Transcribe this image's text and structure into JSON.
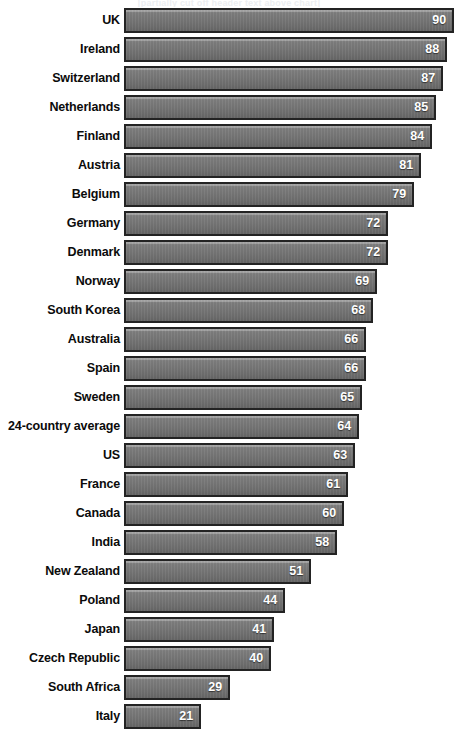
{
  "header": {
    "clipped_title": "[partially cut off header text above chart]"
  },
  "chart_data": {
    "type": "bar",
    "orientation": "horizontal",
    "title": "",
    "subtitle": "",
    "xlabel": "",
    "ylabel": "",
    "xlim": [
      0,
      90
    ],
    "grid": false,
    "legend": false,
    "value_labels": true,
    "value_label_position": "inside-end",
    "bar_color": "#767676",
    "bar_border_color": "#232323",
    "value_text_color": "#ffffff",
    "label_text_color": "#0b0b0b",
    "background_color": "#ffffff",
    "sorted": "descending",
    "categories": [
      "UK",
      "Ireland",
      "Switzerland",
      "Netherlands",
      "Finland",
      "Austria",
      "Belgium",
      "Germany",
      "Denmark",
      "Norway",
      "South Korea",
      "Australia",
      "Spain",
      "Sweden",
      "24-country average",
      "US",
      "France",
      "Canada",
      "India",
      "New Zealand",
      "Poland",
      "Japan",
      "Czech Republic",
      "South Africa",
      "Italy"
    ],
    "values": [
      90,
      88,
      87,
      85,
      84,
      81,
      79,
      72,
      72,
      69,
      68,
      66,
      66,
      65,
      64,
      63,
      61,
      60,
      58,
      51,
      44,
      41,
      40,
      29,
      21
    ],
    "rows": [
      {
        "label": "UK",
        "value": 90
      },
      {
        "label": "Ireland",
        "value": 88
      },
      {
        "label": "Switzerland",
        "value": 87
      },
      {
        "label": "Netherlands",
        "value": 85
      },
      {
        "label": "Finland",
        "value": 84
      },
      {
        "label": "Austria",
        "value": 81
      },
      {
        "label": "Belgium",
        "value": 79
      },
      {
        "label": "Germany",
        "value": 72
      },
      {
        "label": "Denmark",
        "value": 72
      },
      {
        "label": "Norway",
        "value": 69
      },
      {
        "label": "South Korea",
        "value": 68
      },
      {
        "label": "Australia",
        "value": 66
      },
      {
        "label": "Spain",
        "value": 66
      },
      {
        "label": "Sweden",
        "value": 65
      },
      {
        "label": "24-country average",
        "value": 64
      },
      {
        "label": "US",
        "value": 63
      },
      {
        "label": "France",
        "value": 61
      },
      {
        "label": "Canada",
        "value": 60
      },
      {
        "label": "India",
        "value": 58
      },
      {
        "label": "New Zealand",
        "value": 51
      },
      {
        "label": "Poland",
        "value": 44
      },
      {
        "label": "Japan",
        "value": 41
      },
      {
        "label": "Czech Republic",
        "value": 40
      },
      {
        "label": "South Africa",
        "value": 29
      },
      {
        "label": "Italy",
        "value": 21
      }
    ]
  }
}
